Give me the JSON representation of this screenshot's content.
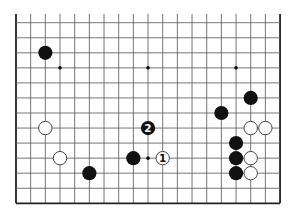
{
  "diagram": {
    "type": "go-board-partial",
    "colors": {
      "background": "#ffffff",
      "grid": "#555555",
      "edge": "#222222",
      "black_stone": "#111111",
      "white_stone": "#ffffff",
      "white_stroke": "#333333"
    },
    "grid": {
      "columns": 19,
      "rows": 13,
      "origin_x": 16,
      "origin_y": 22.7,
      "spacing_x": 14.67,
      "spacing_y": 15.05,
      "top_cut_y": 14,
      "edges": [
        "left",
        "right",
        "bottom"
      ]
    },
    "star_points": [
      {
        "col": 3,
        "row": 3
      },
      {
        "col": 9,
        "row": 3
      },
      {
        "col": 15,
        "row": 3
      },
      {
        "col": 9,
        "row": 9
      }
    ],
    "stones": [
      {
        "color": "black",
        "col": 2,
        "row": 2,
        "label": ""
      },
      {
        "color": "black",
        "col": 16,
        "row": 5,
        "label": ""
      },
      {
        "color": "black",
        "col": 14,
        "row": 6,
        "label": ""
      },
      {
        "color": "white",
        "col": 2,
        "row": 7,
        "label": ""
      },
      {
        "color": "black",
        "col": 9,
        "row": 7,
        "label": "2"
      },
      {
        "color": "white",
        "col": 16,
        "row": 7,
        "label": ""
      },
      {
        "color": "white",
        "col": 17,
        "row": 7,
        "label": ""
      },
      {
        "color": "black",
        "col": 15,
        "row": 8,
        "label": ""
      },
      {
        "color": "white",
        "col": 3,
        "row": 9,
        "label": ""
      },
      {
        "color": "black",
        "col": 8,
        "row": 9,
        "label": ""
      },
      {
        "color": "white",
        "col": 10,
        "row": 9,
        "label": "1"
      },
      {
        "color": "black",
        "col": 15,
        "row": 9,
        "label": ""
      },
      {
        "color": "white",
        "col": 16,
        "row": 9,
        "label": ""
      },
      {
        "color": "black",
        "col": 5,
        "row": 10,
        "label": ""
      },
      {
        "color": "black",
        "col": 15,
        "row": 10,
        "label": ""
      },
      {
        "color": "white",
        "col": 16,
        "row": 10,
        "label": ""
      }
    ]
  }
}
